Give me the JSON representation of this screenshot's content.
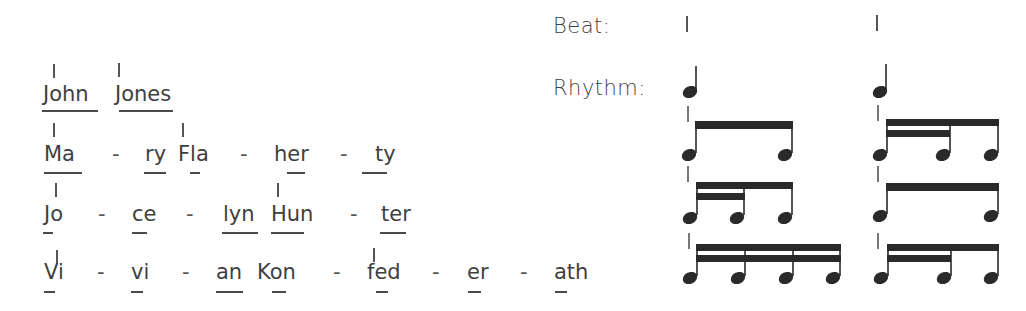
{
  "labels": {
    "beat": "Beat:",
    "rhythm": "Rhythm:"
  },
  "names": [
    {
      "full": "John Jones",
      "syllables": [
        "John",
        "Jones"
      ],
      "beat_syllables": [
        "John",
        "Jones"
      ],
      "rhythm": [
        "quarter",
        "quarter"
      ]
    },
    {
      "full": "Mary Flaherty",
      "syllables": [
        "Ma",
        "-",
        "ry",
        "Fla",
        "-",
        "her",
        "-",
        "ty"
      ],
      "beat_syllables": [
        "Ma",
        "Fla"
      ],
      "rhythm": [
        "two-eighths",
        "eighth-two-sixteenths"
      ]
    },
    {
      "full": "Jocelyn Hunter",
      "syllables": [
        "Jo",
        "-",
        "ce",
        "-",
        "lyn",
        "Hun",
        "-",
        "ter"
      ],
      "beat_syllables": [
        "Jo",
        "Hun"
      ],
      "rhythm": [
        "two-sixteenths-eighth",
        "two-eighths"
      ]
    },
    {
      "full": "Vivian Konfederath",
      "syllables": [
        "Vi",
        "-",
        "vi",
        "-",
        "an",
        "Kon",
        "-",
        "fed",
        "-",
        "er",
        "-",
        "ath"
      ],
      "beat_syllables": [
        "Vi",
        "fed"
      ],
      "rhythm": [
        "four-sixteenths",
        "two-sixteenths-eighth"
      ]
    }
  ],
  "text": {
    "r1": {
      "s1": "John",
      "s2": "Jones"
    },
    "r2": {
      "s1": "Ma",
      "d1": "-",
      "s2": "ry",
      "s3": "Fla",
      "d2": "-",
      "s4": "her",
      "d3": "-",
      "s5": "ty"
    },
    "r3": {
      "s1": "Jo",
      "d1": "-",
      "s2": "ce",
      "d2": "-",
      "s3": "lyn",
      "s4": "Hun",
      "d3": "-",
      "s5": "ter"
    },
    "r4": {
      "s1": "Vi",
      "d1": "-",
      "s2": "vi",
      "d2": "-",
      "s3": "an",
      "s4": "Kon",
      "d3": "-",
      "s5": "fed",
      "d4": "-",
      "s6": "er",
      "d5": "-",
      "s7": "ath"
    }
  },
  "colors": {
    "ink": "#2a2a2a",
    "text": "#3f3f3f"
  }
}
